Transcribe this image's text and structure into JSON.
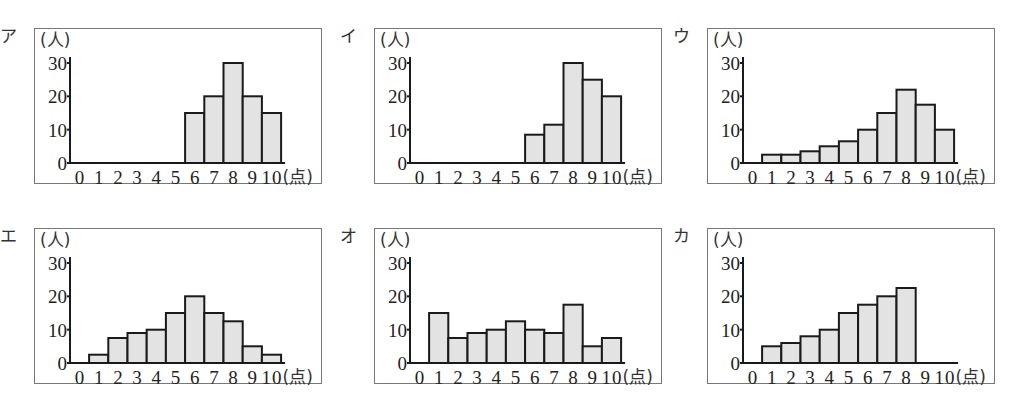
{
  "chart_data": [
    {
      "type": "bar",
      "label": "ア",
      "title": "",
      "xlabel": "(点)",
      "ylabel": "(人)",
      "categories": [
        "0",
        "1",
        "2",
        "3",
        "4",
        "5",
        "6",
        "7",
        "8",
        "9",
        "10"
      ],
      "values": [
        0,
        0,
        0,
        0,
        0,
        0,
        15,
        20,
        30,
        20,
        15
      ],
      "yticks": [
        "0",
        "10",
        "20",
        "30"
      ],
      "ylim": [
        0,
        30
      ],
      "grid": false
    },
    {
      "type": "bar",
      "label": "イ",
      "title": "",
      "xlabel": "(点)",
      "ylabel": "(人)",
      "categories": [
        "0",
        "1",
        "2",
        "3",
        "4",
        "5",
        "6",
        "7",
        "8",
        "9",
        "10"
      ],
      "values": [
        0,
        0,
        0,
        0,
        0,
        0,
        8.5,
        11.5,
        30,
        25,
        20
      ],
      "yticks": [
        "0",
        "10",
        "20",
        "30"
      ],
      "ylim": [
        0,
        30
      ],
      "grid": false
    },
    {
      "type": "bar",
      "label": "ウ",
      "title": "",
      "xlabel": "(点)",
      "ylabel": "(人)",
      "categories": [
        "0",
        "1",
        "2",
        "3",
        "4",
        "5",
        "6",
        "7",
        "8",
        "9",
        "10"
      ],
      "values": [
        0,
        2.5,
        2.5,
        3.5,
        5,
        6.5,
        10,
        15,
        22,
        17.5,
        10
      ],
      "yticks": [
        "0",
        "10",
        "20",
        "30"
      ],
      "ylim": [
        0,
        30
      ],
      "grid": false
    },
    {
      "type": "bar",
      "label": "エ",
      "title": "",
      "xlabel": "(点)",
      "ylabel": "(人)",
      "categories": [
        "0",
        "1",
        "2",
        "3",
        "4",
        "5",
        "6",
        "7",
        "8",
        "9",
        "10"
      ],
      "values": [
        0,
        2.5,
        7.5,
        9,
        10,
        15,
        20,
        15,
        12.5,
        5,
        2.5
      ],
      "yticks": [
        "0",
        "10",
        "20",
        "30"
      ],
      "ylim": [
        0,
        30
      ],
      "grid": false
    },
    {
      "type": "bar",
      "label": "オ",
      "title": "",
      "xlabel": "(点)",
      "ylabel": "(人)",
      "categories": [
        "0",
        "1",
        "2",
        "3",
        "4",
        "5",
        "6",
        "7",
        "8",
        "9",
        "10"
      ],
      "values": [
        0,
        15,
        7.5,
        9,
        10,
        12.5,
        10,
        9,
        17.5,
        5,
        7.5
      ],
      "yticks": [
        "0",
        "10",
        "20",
        "30"
      ],
      "ylim": [
        0,
        30
      ],
      "grid": false
    },
    {
      "type": "bar",
      "label": "カ",
      "title": "",
      "xlabel": "(点)",
      "ylabel": "(人)",
      "categories": [
        "0",
        "1",
        "2",
        "3",
        "4",
        "5",
        "6",
        "7",
        "8",
        "9",
        "10"
      ],
      "values": [
        0,
        5,
        6,
        8,
        10,
        15,
        17.5,
        20,
        22.5,
        0,
        0
      ],
      "yticks": [
        "0",
        "10",
        "20",
        "30"
      ],
      "ylim": [
        0,
        30
      ],
      "grid": false
    }
  ],
  "layout": {
    "panel_positions": [
      [
        0,
        0
      ],
      [
        340,
        0
      ],
      [
        673,
        0
      ],
      [
        0,
        200
      ],
      [
        340,
        200
      ],
      [
        673,
        200
      ]
    ],
    "bar_fill": "#e3e3e3",
    "bar_stroke": "#1a1a1a",
    "frame_color": "#777777"
  }
}
